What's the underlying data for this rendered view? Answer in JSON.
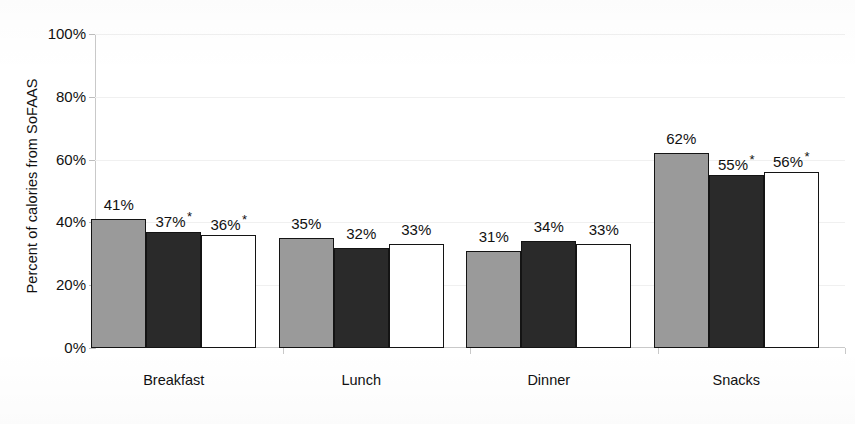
{
  "chart_data": {
    "type": "bar",
    "title": "",
    "subtitle": "",
    "xlabel": "",
    "ylabel": "Percent of calories from SoFAAS",
    "ylim": [
      0,
      100
    ],
    "yticks": [
      "0%",
      "20%",
      "40%",
      "60%",
      "80%",
      "100%"
    ],
    "ytick_values": [
      0,
      20,
      40,
      60,
      80,
      100
    ],
    "grid": "horizontal-faint",
    "legend": "none",
    "categories": [
      "Breakfast",
      "Lunch",
      "Dinner",
      "Snacks"
    ],
    "series": [
      {
        "name": "series-a",
        "color": "#9a9a9a",
        "values": [
          41,
          35,
          31,
          62
        ],
        "labels": [
          "41%",
          "35%",
          "31%",
          "62%"
        ],
        "significance": [
          "",
          "",
          "",
          ""
        ]
      },
      {
        "name": "series-b",
        "color": "#2a2a2a",
        "values": [
          37,
          32,
          34,
          55
        ],
        "labels": [
          "37%",
          "32%",
          "34%",
          "55%"
        ],
        "significance": [
          "*",
          "",
          "",
          "*"
        ]
      },
      {
        "name": "series-c",
        "color": "#ffffff",
        "values": [
          36,
          33,
          33,
          56
        ],
        "labels": [
          "36%",
          "33%",
          "33%",
          "56%"
        ],
        "significance": [
          "*",
          "",
          "",
          "*"
        ]
      }
    ],
    "annotations": {
      "asterisk_meaning": "*"
    }
  },
  "axis": {
    "y_title": "Percent of calories from SoFAAS",
    "ticks": [
      {
        "label": "100%"
      },
      {
        "label": "80%"
      },
      {
        "label": "60%"
      },
      {
        "label": "40%"
      },
      {
        "label": "20%"
      },
      {
        "label": "0%"
      }
    ]
  },
  "groups": [
    {
      "label": "Breakfast",
      "bars": [
        {
          "label": "41%",
          "star": "",
          "value": 41,
          "series": "a"
        },
        {
          "label": "37%",
          "star": "*",
          "value": 37,
          "series": "b"
        },
        {
          "label": "36%",
          "star": "*",
          "value": 36,
          "series": "c"
        }
      ]
    },
    {
      "label": "Lunch",
      "bars": [
        {
          "label": "35%",
          "star": "",
          "value": 35,
          "series": "a"
        },
        {
          "label": "32%",
          "star": "",
          "value": 32,
          "series": "b"
        },
        {
          "label": "33%",
          "star": "",
          "value": 33,
          "series": "c"
        }
      ]
    },
    {
      "label": "Dinner",
      "bars": [
        {
          "label": "31%",
          "star": "",
          "value": 31,
          "series": "a"
        },
        {
          "label": "34%",
          "star": "",
          "value": 34,
          "series": "b"
        },
        {
          "label": "33%",
          "star": "",
          "value": 33,
          "series": "c"
        }
      ]
    },
    {
      "label": "Snacks",
      "bars": [
        {
          "label": "62%",
          "star": "",
          "value": 62,
          "series": "a"
        },
        {
          "label": "55%",
          "star": "*",
          "value": 55,
          "series": "b"
        },
        {
          "label": "56%",
          "star": "*",
          "value": 56,
          "series": "c"
        }
      ]
    }
  ],
  "colors": {
    "series_a": "#9a9a9a",
    "series_b": "#2a2a2a",
    "series_c": "#ffffff",
    "bar_outline": "#141414",
    "axis": "#c9c9c9",
    "gridline": "#f0f0f0",
    "text": "#111111"
  }
}
